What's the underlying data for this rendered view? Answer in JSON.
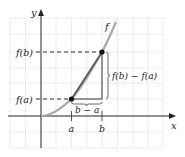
{
  "figure": {
    "axes": {
      "x_label": "x",
      "y_label": "y"
    },
    "curve_label": "f",
    "ticks": {
      "x": [
        "a",
        "b"
      ],
      "y": [
        "f(a)",
        "f(b)"
      ]
    },
    "annotations": {
      "rise": "f(b) − f(a)",
      "run": "b − a"
    },
    "colors": {
      "curve": "#a8a8a8",
      "secant": "#555555",
      "axes": "#222222",
      "grid": "#d8d8d8",
      "points": "#111111"
    }
  }
}
